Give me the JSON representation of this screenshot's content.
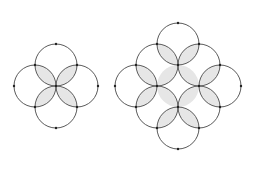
{
  "diagram": {
    "style": {
      "background": "#ffffff",
      "stroke": "#5a5a5a",
      "shade": "#e6e6e6",
      "dot": "#222222"
    },
    "radius": 21,
    "figures": [
      {
        "name": "four-circle-flower",
        "circles": [
          [
            56,
            65
          ],
          [
            35,
            86
          ],
          [
            77,
            86
          ],
          [
            56,
            107
          ]
        ],
        "lenses": [
          [
            [
              56,
              86
            ],
            [
              35,
              65
            ],
            [
              56,
              65
            ],
            [
              35,
              86
            ]
          ],
          [
            [
              56,
              86
            ],
            [
              77,
              65
            ],
            [
              56,
              65
            ],
            [
              77,
              86
            ]
          ],
          [
            [
              56,
              86
            ],
            [
              35,
              107
            ],
            [
              56,
              107
            ],
            [
              35,
              86
            ]
          ],
          [
            [
              56,
              86
            ],
            [
              77,
              107
            ],
            [
              56,
              107
            ],
            [
              77,
              86
            ]
          ]
        ],
        "dots": [
          [
            56,
            44
          ],
          [
            14,
            86
          ],
          [
            98,
            86
          ],
          [
            56,
            128
          ],
          [
            35,
            65
          ],
          [
            77,
            65
          ],
          [
            35,
            107
          ],
          [
            77,
            107
          ],
          [
            56,
            86
          ]
        ]
      },
      {
        "name": "eight-circle-ring",
        "circles": [
          [
            178,
            44
          ],
          [
            157,
            65
          ],
          [
            199,
            65
          ],
          [
            136,
            86
          ],
          [
            220,
            86
          ],
          [
            157,
            107
          ],
          [
            199,
            107
          ],
          [
            178,
            128
          ]
        ],
        "lenses": [
          [
            [
              157,
              44
            ],
            [
              178,
              65
            ],
            [
              178,
              44
            ],
            [
              157,
              65
            ]
          ],
          [
            [
              199,
              44
            ],
            [
              178,
              65
            ],
            [
              178,
              44
            ],
            [
              199,
              65
            ]
          ],
          [
            [
              136,
              65
            ],
            [
              157,
              86
            ],
            [
              136,
              86
            ],
            [
              157,
              65
            ]
          ],
          [
            [
              220,
              65
            ],
            [
              199,
              86
            ],
            [
              220,
              86
            ],
            [
              199,
              65
            ]
          ],
          [
            [
              136,
              107
            ],
            [
              157,
              86
            ],
            [
              136,
              86
            ],
            [
              157,
              107
            ]
          ],
          [
            [
              220,
              107
            ],
            [
              199,
              86
            ],
            [
              220,
              86
            ],
            [
              199,
              107
            ]
          ],
          [
            [
              157,
              128
            ],
            [
              178,
              107
            ],
            [
              178,
              128
            ],
            [
              157,
              107
            ]
          ],
          [
            [
              199,
              128
            ],
            [
              178,
              107
            ],
            [
              178,
              128
            ],
            [
              199,
              107
            ]
          ],
          [
            [
              178,
              65
            ],
            [
              157,
              86
            ],
            [
              157,
              65
            ],
            [
              178,
              86
            ]
          ],
          [
            [
              178,
              65
            ],
            [
              199,
              86
            ],
            [
              199,
              65
            ],
            [
              178,
              86
            ]
          ],
          [
            [
              178,
              107
            ],
            [
              157,
              86
            ],
            [
              157,
              107
            ],
            [
              178,
              86
            ]
          ],
          [
            [
              178,
              107
            ],
            [
              199,
              86
            ],
            [
              199,
              107
            ],
            [
              178,
              86
            ]
          ]
        ],
        "dots": [
          [
            178,
            23
          ],
          [
            115,
            86
          ],
          [
            241,
            86
          ],
          [
            178,
            149
          ],
          [
            157,
            44
          ],
          [
            199,
            44
          ],
          [
            136,
            65
          ],
          [
            220,
            65
          ],
          [
            136,
            107
          ],
          [
            220,
            107
          ],
          [
            157,
            128
          ],
          [
            199,
            128
          ],
          [
            178,
            65
          ],
          [
            157,
            86
          ],
          [
            199,
            86
          ],
          [
            178,
            107
          ]
        ]
      }
    ]
  }
}
